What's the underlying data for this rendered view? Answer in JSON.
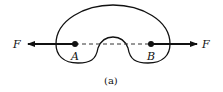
{
  "diagram": {
    "type": "free-body / force diagram",
    "body_shape": "kidney-shaped rigid body",
    "points": [
      {
        "label": "A",
        "x": 75,
        "y": 44
      },
      {
        "label": "B",
        "x": 151,
        "y": 44
      }
    ],
    "forces": [
      {
        "label": "F",
        "direction": "left",
        "applied_at": "A"
      },
      {
        "label": "F",
        "direction": "right",
        "applied_at": "B"
      }
    ],
    "connector": "dashed line from A to B",
    "caption": "(a)",
    "colors": {
      "stroke": "#111111",
      "background": "#ffffff"
    }
  }
}
